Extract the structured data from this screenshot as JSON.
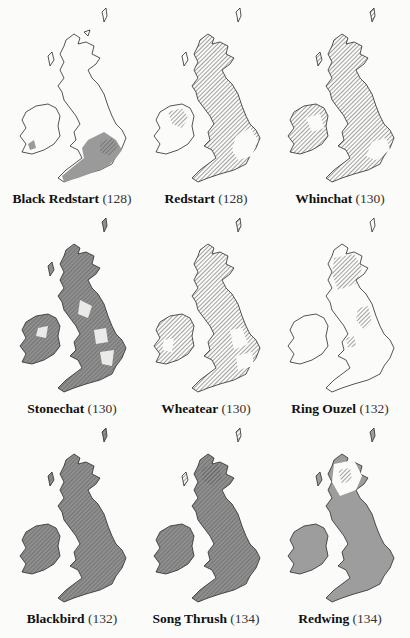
{
  "colors": {
    "background": "#fbfbf9",
    "outline": "#2a2a2a",
    "solid_fill": "#9a9a9a",
    "hatch": "#555555"
  },
  "legend": {
    "solid": "resident / main range (grey stipple)",
    "hatched": "range (hatched)",
    "blank": "absent"
  },
  "maps": [
    {
      "name": "Black Redstart",
      "page": "(128)",
      "pattern": "outline-se-solid"
    },
    {
      "name": "Redstart",
      "page": "(128)",
      "pattern": "hatch-north-west"
    },
    {
      "name": "Whinchat",
      "page": "(130)",
      "pattern": "hatch-most"
    },
    {
      "name": "Stonechat",
      "page": "(130)",
      "pattern": "solid-patchy"
    },
    {
      "name": "Wheatear",
      "page": "(130)",
      "pattern": "hatch-patchy"
    },
    {
      "name": "Ring Ouzel",
      "page": "(132)",
      "pattern": "hatch-uplands"
    },
    {
      "name": "Blackbird",
      "page": "(132)",
      "pattern": "solid-hatch-full"
    },
    {
      "name": "Song Thrush",
      "page": "(134)",
      "pattern": "solid-hatch-full"
    },
    {
      "name": "Redwing",
      "page": "(134)",
      "pattern": "solid-full-scot-hatch"
    }
  ]
}
